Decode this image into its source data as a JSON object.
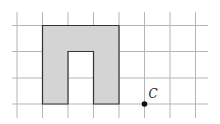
{
  "figure": {
    "grid": {
      "cell_size": 25.5,
      "x_lines": [
        17,
        42.5,
        68,
        93.5,
        119,
        144.5,
        170,
        195.5
      ],
      "y_lines": [
        25.5,
        51.5,
        78,
        104
      ],
      "x_extent": [
        12,
        208
      ],
      "y_extent": [
        12,
        118
      ],
      "color": "#b5b5b5"
    },
    "shape": {
      "description": "Arch-shaped (inverted U) shaded polygon",
      "fill": "#d4d4d4",
      "stroke": "#333333",
      "points_grid": [
        [
          1,
          0
        ],
        [
          4,
          0
        ],
        [
          4,
          3
        ],
        [
          3,
          3
        ],
        [
          3,
          1
        ],
        [
          2,
          1
        ],
        [
          2,
          3
        ],
        [
          1,
          3
        ]
      ]
    },
    "point": {
      "label": "C",
      "grid_position": [
        5,
        3
      ],
      "color": "#111111"
    }
  }
}
